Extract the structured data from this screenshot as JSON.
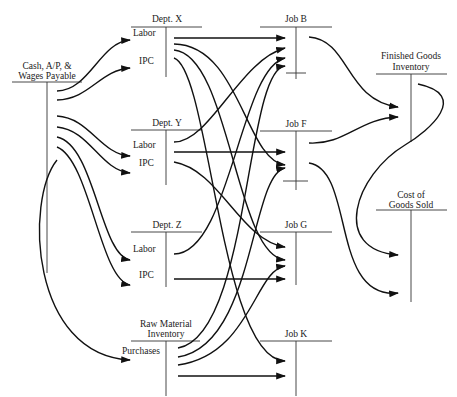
{
  "diagram": {
    "type": "cost-flow-t-accounts",
    "accounts": [
      {
        "id": "cash",
        "label": "Cash, A/P, &\nWages Payable",
        "line1": "Cash, A/P, &",
        "line2": "Wages Payable"
      },
      {
        "id": "deptx",
        "label": "Dept. X"
      },
      {
        "id": "depty",
        "label": "Dept. Y"
      },
      {
        "id": "deptz",
        "label": "Dept. Z"
      },
      {
        "id": "rawmat",
        "label": "Raw Material Inventory",
        "line1": "Raw Material",
        "line2": "Inventory"
      },
      {
        "id": "jobb",
        "label": "Job B"
      },
      {
        "id": "jobf",
        "label": "Job F"
      },
      {
        "id": "jobg",
        "label": "Job G"
      },
      {
        "id": "jobk",
        "label": "Job K"
      },
      {
        "id": "fgi",
        "label": "Finished Goods Inventory",
        "line1": "Finished Goods",
        "line2": "Inventory"
      },
      {
        "id": "cogs",
        "label": "Cost of Goods Sold",
        "line1": "Cost of",
        "line2": "Goods Sold"
      }
    ],
    "flow_labels": {
      "labor": "Labor",
      "ipc": "IPC",
      "purchases": "Purchases"
    },
    "flows": [
      {
        "from": "cash",
        "to": "deptx",
        "label": "Labor"
      },
      {
        "from": "cash",
        "to": "deptx",
        "label": "IPC"
      },
      {
        "from": "cash",
        "to": "depty",
        "label": "Labor"
      },
      {
        "from": "cash",
        "to": "depty",
        "label": "IPC"
      },
      {
        "from": "cash",
        "to": "deptz",
        "label": "Labor"
      },
      {
        "from": "cash",
        "to": "deptz",
        "label": "IPC"
      },
      {
        "from": "cash",
        "to": "rawmat",
        "label": "Purchases"
      },
      {
        "from": "deptx",
        "to": "jobb"
      },
      {
        "from": "deptx",
        "to": "jobf"
      },
      {
        "from": "deptx",
        "to": "jobg"
      },
      {
        "from": "deptx",
        "to": "jobk"
      },
      {
        "from": "depty",
        "to": "jobb"
      },
      {
        "from": "depty",
        "to": "jobf"
      },
      {
        "from": "depty",
        "to": "jobg"
      },
      {
        "from": "deptz",
        "to": "jobb"
      },
      {
        "from": "deptz",
        "to": "jobg"
      },
      {
        "from": "rawmat",
        "to": "jobb"
      },
      {
        "from": "rawmat",
        "to": "jobf"
      },
      {
        "from": "rawmat",
        "to": "jobg"
      },
      {
        "from": "rawmat",
        "to": "jobk"
      },
      {
        "from": "jobb",
        "to": "fgi"
      },
      {
        "from": "jobf",
        "to": "fgi"
      },
      {
        "from": "jobf",
        "to": "cogs"
      },
      {
        "from": "fgi",
        "to": "cogs"
      }
    ],
    "colors": {
      "ink": "#111111",
      "background": "#ffffff"
    }
  }
}
